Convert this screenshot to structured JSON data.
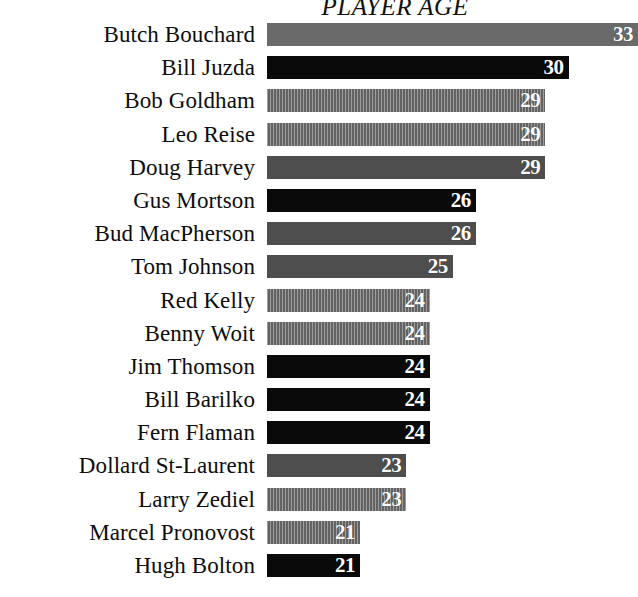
{
  "chart": {
    "title": "PLAYER AGE"
  },
  "chart_data": {
    "type": "bar",
    "title": "PLAYER AGE",
    "xlabel": "",
    "ylabel": "",
    "orientation": "horizontal",
    "grid": false,
    "legend": false,
    "xlim": [
      0,
      33
    ],
    "categories": [
      "Butch Bouchard",
      "Bill Juzda",
      "Bob Goldham",
      "Leo Reise",
      "Doug Harvey",
      "Gus Mortson",
      "Bud MacPherson",
      "Tom Johnson",
      "Red Kelly",
      "Benny Woit",
      "Jim Thomson",
      "Bill Barilko",
      "Fern Flaman",
      "Dollard St-Laurent",
      "Larry Zediel",
      "Marcel Pronovost",
      "Hugh Bolton"
    ],
    "values": [
      33,
      30,
      29,
      29,
      29,
      26,
      26,
      25,
      24,
      24,
      24,
      24,
      24,
      23,
      23,
      21,
      21
    ],
    "bar_styles": [
      "midgray",
      "black",
      "striped",
      "striped",
      "darkgray",
      "black",
      "darkgray",
      "darkgray",
      "striped",
      "striped",
      "black",
      "black",
      "black",
      "darkgray",
      "striped",
      "striped",
      "black"
    ],
    "colors": {
      "black": "#0a0a0a",
      "darkgray": "#4e4e4e",
      "midgray": "#6a6a6a",
      "striped": "#6e6e6e",
      "value_text": "#ffffff",
      "label_text": "#0d0d0d",
      "background": "#ffffff"
    },
    "rows": [
      {
        "name": "Butch Bouchard",
        "value": 33,
        "label": "33",
        "style": "midgray"
      },
      {
        "name": "Bill Juzda",
        "value": 30,
        "label": "30",
        "style": "black"
      },
      {
        "name": "Bob Goldham",
        "value": 29,
        "label": "29",
        "style": "striped"
      },
      {
        "name": "Leo Reise",
        "value": 29,
        "label": "29",
        "style": "striped"
      },
      {
        "name": "Doug Harvey",
        "value": 29,
        "label": "29",
        "style": "darkgray"
      },
      {
        "name": "Gus Mortson",
        "value": 26,
        "label": "26",
        "style": "black"
      },
      {
        "name": "Bud MacPherson",
        "value": 26,
        "label": "26",
        "style": "darkgray"
      },
      {
        "name": "Tom Johnson",
        "value": 25,
        "label": "25",
        "style": "darkgray"
      },
      {
        "name": "Red Kelly",
        "value": 24,
        "label": "24",
        "style": "striped"
      },
      {
        "name": "Benny Woit",
        "value": 24,
        "label": "24",
        "style": "striped"
      },
      {
        "name": "Jim Thomson",
        "value": 24,
        "label": "24",
        "style": "black"
      },
      {
        "name": "Bill Barilko",
        "value": 24,
        "label": "24",
        "style": "black"
      },
      {
        "name": "Fern Flaman",
        "value": 24,
        "label": "24",
        "style": "black"
      },
      {
        "name": "Dollard St-Laurent",
        "value": 23,
        "label": "23",
        "style": "darkgray"
      },
      {
        "name": "Larry Zediel",
        "value": 23,
        "label": "23",
        "style": "striped"
      },
      {
        "name": "Marcel Pronovost",
        "value": 21,
        "label": "21",
        "style": "striped"
      },
      {
        "name": "Hugh Bolton",
        "value": 21,
        "label": "21",
        "style": "black"
      }
    ]
  }
}
